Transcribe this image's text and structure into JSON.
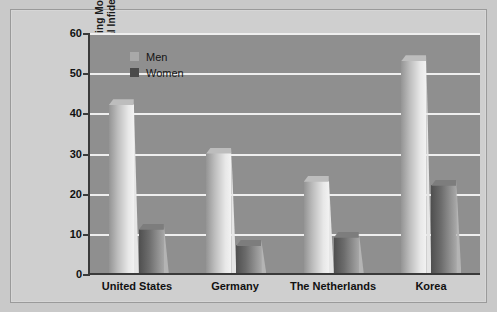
{
  "chart_data": {
    "type": "bar",
    "title": "",
    "xlabel": "",
    "ylabel_line1": "Percentage Reporting More",
    "ylabel_line2": "Distress over Sexual Infidelity",
    "categories": [
      "United States",
      "Germany",
      "The Netherlands",
      "Korea"
    ],
    "series": [
      {
        "name": "Men",
        "values": [
          42,
          30,
          23,
          53
        ]
      },
      {
        "name": "Women",
        "values": [
          11,
          7,
          9,
          22
        ]
      }
    ],
    "ylim": [
      0,
      60
    ],
    "yticks": [
      0,
      10,
      20,
      30,
      40,
      50,
      60
    ],
    "ytick_labels": [
      "0",
      "10",
      "20",
      "30",
      "40",
      "50",
      "60"
    ],
    "grid": true,
    "legend_position": "top-left",
    "colors": {
      "men": "#d8d8d8",
      "women": "#5a5a5a",
      "plot_background": "#8f8f8f",
      "figure_background": "#cfcfcf",
      "gridline": "#efefef",
      "axis": "#3a3a3a",
      "text": "#111111"
    }
  }
}
